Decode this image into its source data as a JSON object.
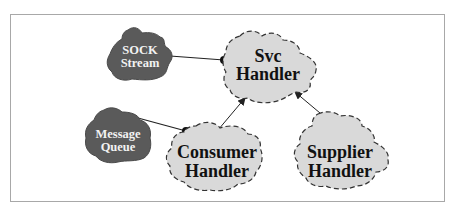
{
  "diagram": {
    "colors": {
      "frame_border": "#a8a8a8",
      "dark_cloud_fill": "#5a5a5a",
      "light_cloud_fill": "#d9d9d9",
      "cloud_outline": "#333333",
      "connector": "#222222"
    },
    "nodes": [
      {
        "id": "sock-stream",
        "style": "dark-solid",
        "line1": "SOCK",
        "line2": "Stream"
      },
      {
        "id": "svc-handler",
        "style": "light-dashed",
        "line1": "Svc",
        "line2": "Handler"
      },
      {
        "id": "message-queue",
        "style": "dark-solid",
        "line1": "Message",
        "line2": "Queue"
      },
      {
        "id": "consumer-handler",
        "style": "light-dashed",
        "line1": "Consumer",
        "line2": "Handler"
      },
      {
        "id": "supplier-handler",
        "style": "light-dashed",
        "line1": "Supplier",
        "line2": "Handler"
      }
    ],
    "edges": [
      {
        "from": "sock-stream",
        "to": "svc-handler",
        "type": "composition-dot"
      },
      {
        "from": "message-queue",
        "to": "consumer-handler",
        "type": "composition-dot"
      },
      {
        "from": "consumer-handler",
        "to": "svc-handler",
        "type": "inheritance-arrow"
      },
      {
        "from": "supplier-handler",
        "to": "svc-handler",
        "type": "inheritance-arrow"
      }
    ]
  }
}
